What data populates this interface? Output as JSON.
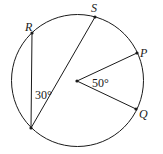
{
  "diagram": {
    "type": "circle-geometry",
    "circle": {
      "cx": 77.5,
      "cy": 80.5,
      "r": 66
    },
    "center": {
      "x": 77,
      "y": 81
    },
    "points": [
      {
        "id": "R",
        "label": "R",
        "x": 32,
        "y": 33,
        "lx": 24,
        "ly": 30
      },
      {
        "id": "S",
        "label": "S",
        "x": 95,
        "y": 17,
        "lx": 91,
        "ly": 12
      },
      {
        "id": "P",
        "label": "P",
        "x": 137,
        "y": 53,
        "lx": 141,
        "ly": 57
      },
      {
        "id": "Q",
        "label": "Q",
        "x": 136,
        "y": 109,
        "lx": 140,
        "ly": 119
      },
      {
        "id": "B",
        "label": "",
        "x": 31,
        "y": 128
      }
    ],
    "segments": [
      {
        "from": "R",
        "to": "B"
      },
      {
        "from": "B",
        "to": "S"
      },
      {
        "from": "center",
        "to": "P"
      },
      {
        "from": "center",
        "to": "Q"
      }
    ],
    "angles": [
      {
        "label": "30°",
        "at": "inscribed angle RBS",
        "x": 35,
        "y": 99
      },
      {
        "label": "50°",
        "at": "central angle POQ",
        "x": 92,
        "y": 86
      }
    ],
    "colors": {
      "stroke": "#1a1a1a",
      "background": "#ffffff"
    }
  }
}
